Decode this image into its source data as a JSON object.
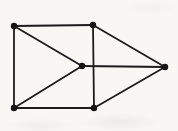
{
  "canvas": {
    "width": 178,
    "height": 131,
    "background_color": "#f8f7f4"
  },
  "diagram": {
    "type": "undirected-graph",
    "stroke_color": "#1c1c1c",
    "node_color": "#141414",
    "line_width": 1.8,
    "node_radius": 3.2,
    "nodes": [
      {
        "id": "top-left",
        "x": 14,
        "y": 26
      },
      {
        "id": "top-middle",
        "x": 93,
        "y": 25
      },
      {
        "id": "center",
        "x": 82,
        "y": 66
      },
      {
        "id": "right",
        "x": 165,
        "y": 67
      },
      {
        "id": "bottom-left",
        "x": 14,
        "y": 108
      },
      {
        "id": "bottom-middle",
        "x": 94,
        "y": 108
      }
    ],
    "edges": [
      {
        "from": "top-left",
        "to": "top-middle"
      },
      {
        "from": "top-left",
        "to": "bottom-left"
      },
      {
        "from": "top-left",
        "to": "center"
      },
      {
        "from": "bottom-left",
        "to": "center"
      },
      {
        "from": "bottom-left",
        "to": "bottom-middle"
      },
      {
        "from": "top-middle",
        "to": "bottom-middle"
      },
      {
        "from": "top-middle",
        "to": "right"
      },
      {
        "from": "bottom-middle",
        "to": "right"
      },
      {
        "from": "center",
        "to": "right"
      }
    ]
  }
}
